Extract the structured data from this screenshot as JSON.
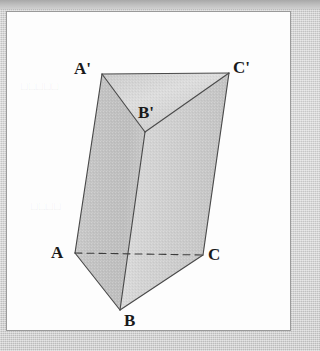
{
  "figure": {
    "solid_type": "triangular-prism",
    "panel": {
      "x": 6,
      "y": 11,
      "width": 285,
      "height": 320,
      "background": "#fdfdfd",
      "border_color": "#9a9a9a"
    },
    "background_color": "#c9c9c9",
    "stroke_color": "#4a4a4a",
    "label_color": "#1a1a1a",
    "vertices": {
      "A": {
        "label": "A",
        "x": 68,
        "y": 241,
        "label_x": 44,
        "label_y": 232,
        "hidden": false
      },
      "B": {
        "label": "B",
        "x": 113,
        "y": 298,
        "label_x": 117,
        "label_y": 300,
        "hidden": false
      },
      "C": {
        "label": "C",
        "x": 196,
        "y": 243,
        "label_x": 201,
        "label_y": 234,
        "hidden": false
      },
      "Ap": {
        "label": "A'",
        "x": 95,
        "y": 62,
        "label_x": 67,
        "label_y": 48,
        "hidden": false
      },
      "Bp": {
        "label": "B'",
        "x": 138,
        "y": 120,
        "label_x": 131,
        "label_y": 92,
        "hidden": false
      },
      "Cp": {
        "label": "C'",
        "x": 222,
        "y": 61,
        "label_x": 226,
        "label_y": 47,
        "hidden": false
      }
    },
    "edges": [
      {
        "name": "A-C",
        "from": "A",
        "to": "C",
        "style": "dashed"
      },
      {
        "name": "A-B",
        "from": "A",
        "to": "B",
        "style": "solid"
      },
      {
        "name": "B-C",
        "from": "B",
        "to": "C",
        "style": "solid"
      },
      {
        "name": "Ap-Bp",
        "from": "Ap",
        "to": "Bp",
        "style": "solid"
      },
      {
        "name": "Bp-Cp",
        "from": "Bp",
        "to": "Cp",
        "style": "solid"
      },
      {
        "name": "Ap-Cp",
        "from": "Ap",
        "to": "Cp",
        "style": "solid"
      },
      {
        "name": "A-Ap",
        "from": "A",
        "to": "Ap",
        "style": "solid"
      },
      {
        "name": "B-Bp",
        "from": "B",
        "to": "Bp",
        "style": "solid"
      },
      {
        "name": "C-Cp",
        "from": "C",
        "to": "Cp",
        "style": "solid"
      }
    ],
    "faces": [
      {
        "name": "top-face-ApBpCp",
        "vertices": [
          "Ap",
          "Bp",
          "Cp"
        ],
        "shade": "#d0d0d0"
      },
      {
        "name": "left-face-A-Ap-Bp-B",
        "vertices": [
          "A",
          "Ap",
          "Bp",
          "B"
        ],
        "shade": "#c4c4c4"
      },
      {
        "name": "right-face-B-Bp-Cp-C",
        "vertices": [
          "B",
          "Bp",
          "Cp",
          "C"
        ],
        "shade": "#cfcfcf"
      }
    ],
    "ghost_text": [
      {
        "text": "□□□□□",
        "x": 20,
        "y": 80
      },
      {
        "text": "□□□□",
        "x": 30,
        "y": 200
      }
    ]
  }
}
